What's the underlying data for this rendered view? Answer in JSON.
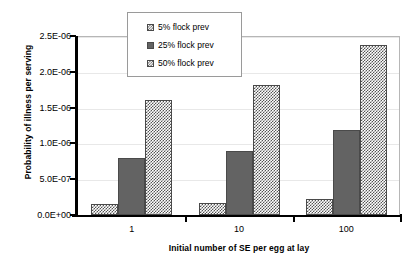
{
  "chart_data": {
    "type": "bar",
    "title": "",
    "xlabel": "Initial number of SE per egg at lay",
    "ylabel": "Probability of illness per serving",
    "categories": [
      "1",
      "10",
      "100"
    ],
    "series": [
      {
        "name": "5% flock prev",
        "values": [
          1.5e-07,
          1.7e-07,
          2.2e-07
        ]
      },
      {
        "name": "25% flock prev",
        "values": [
          8e-07,
          9e-07,
          1.19e-06
        ]
      },
      {
        "name": "50% flock prev",
        "values": [
          1.61e-06,
          1.81e-06,
          2.38e-06
        ]
      }
    ],
    "ylim": [
      0,
      2.5e-06
    ],
    "ytick_labels": [
      "0.0E+00",
      "5.0E-07",
      "1.0E-06",
      "1.5E-06",
      "2.0E-06",
      "2.5E-06"
    ],
    "ytick_values": [
      0,
      5e-07,
      1e-06,
      1.5e-06,
      2e-06,
      2.5e-06
    ],
    "grid": true,
    "legend_position": "top-center"
  },
  "legend": {
    "items": [
      {
        "label": "5% flock prev"
      },
      {
        "label": "25% flock prev"
      },
      {
        "label": "50% flock prev"
      }
    ]
  }
}
